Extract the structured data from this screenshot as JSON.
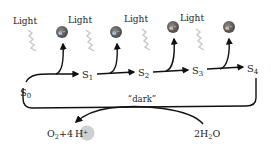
{
  "diagram": {
    "light_label": "Light",
    "electron_label": "e⁻",
    "states": [
      {
        "id": "S0",
        "base": "S",
        "sub": "0"
      },
      {
        "id": "S1",
        "base": "S",
        "sub": "1"
      },
      {
        "id": "S2",
        "base": "S",
        "sub": "2"
      },
      {
        "id": "S3",
        "base": "S",
        "sub": "3"
      },
      {
        "id": "S4",
        "base": "S",
        "sub": "4"
      }
    ],
    "dark_label": "“dark”",
    "water": {
      "prefix": "2H",
      "sub": "2",
      "suffix": "O"
    },
    "products": {
      "o": "O",
      "o_sub": "2",
      "plus": "+4",
      "proton": "H",
      "proton_sup": "+"
    },
    "colors": {
      "arrow": "#111111",
      "electron": "#6b6b6b",
      "proton": "#cfcfcf",
      "light_wave": "#c8c8c8"
    }
  }
}
